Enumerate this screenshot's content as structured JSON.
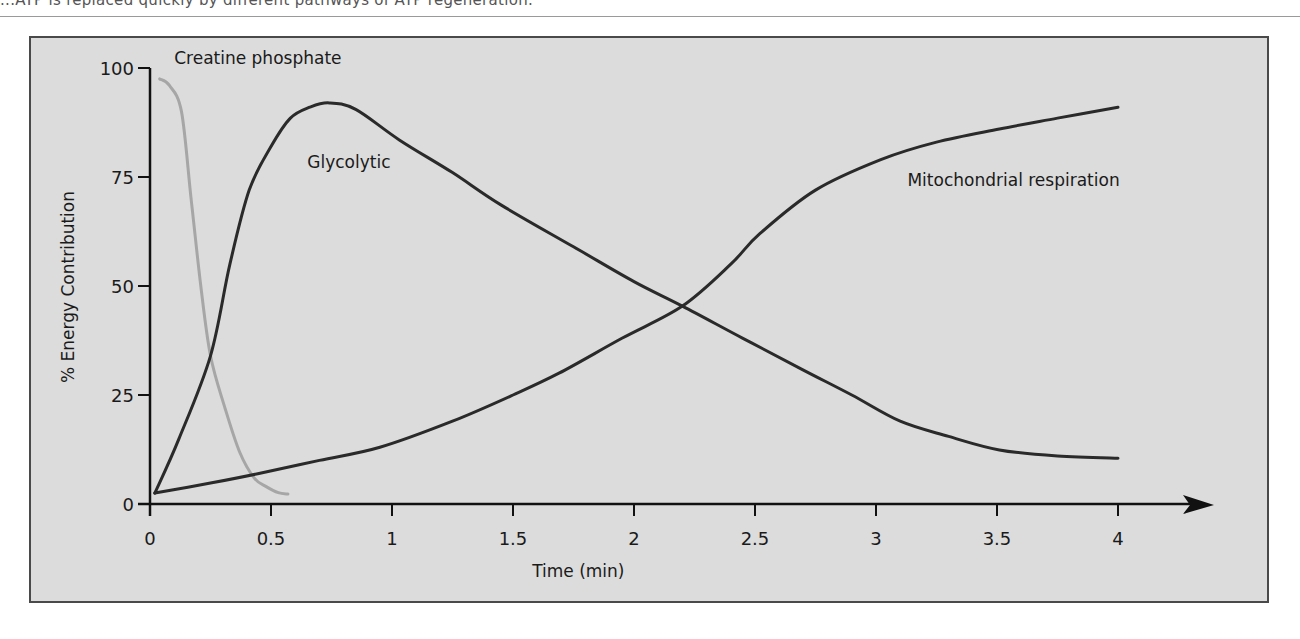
{
  "page": {
    "cut_caption": "...ATP is replaced quickly by different pathways of ATP regeneration."
  },
  "chart_data": {
    "type": "line",
    "title": "",
    "xlabel": "Time (min)",
    "ylabel": "% Energy Contribution",
    "xlim": [
      0,
      4
    ],
    "ylim": [
      0,
      100
    ],
    "x_ticks": [
      0,
      0.5,
      1,
      1.5,
      2,
      2.5,
      3,
      3.5,
      4
    ],
    "x_tick_labels": [
      "0",
      "0.5",
      "1",
      "1.5",
      "2",
      "2.5",
      "3",
      "3.5",
      "4"
    ],
    "y_ticks": [
      0,
      25,
      50,
      75,
      100
    ],
    "y_tick_labels": [
      "0",
      "25",
      "50",
      "75",
      "100"
    ],
    "grid": false,
    "legend": "inline labels",
    "series": [
      {
        "name": "Creatine phosphate",
        "color": "#a6a6a6",
        "label_pos": [
          0.1,
          101
        ],
        "x": [
          0.04,
          0.08,
          0.13,
          0.17,
          0.21,
          0.25,
          0.31,
          0.37,
          0.43,
          0.48,
          0.53,
          0.57
        ],
        "y": [
          97.5,
          96,
          90,
          70,
          50,
          34,
          22,
          12,
          6,
          4,
          2.6,
          2.3
        ]
      },
      {
        "name": "Glycolytic",
        "color": "#2a2a2a",
        "label_pos": [
          0.65,
          77
        ],
        "x": [
          0.02,
          0.12,
          0.25,
          0.33,
          0.41,
          0.5,
          0.58,
          0.66,
          0.74,
          0.85,
          1.03,
          1.25,
          1.45,
          1.75,
          2.0,
          2.2,
          2.45,
          2.69,
          2.9,
          3.1,
          3.3,
          3.51,
          3.75,
          4.0
        ],
        "y": [
          2.5,
          15,
          34,
          55,
          72,
          82,
          88.5,
          91,
          92,
          90.5,
          83.5,
          76,
          68.6,
          59,
          51,
          45.4,
          38,
          31,
          25,
          19,
          15.5,
          12.4,
          11,
          10.5
        ]
      },
      {
        "name": "Mitochondrial respiration",
        "color": "#2a2a2a",
        "label_pos": [
          3.13,
          73
        ],
        "x": [
          0.02,
          0.25,
          0.45,
          0.7,
          0.95,
          1.25,
          1.5,
          1.69,
          1.95,
          2.2,
          2.4,
          2.52,
          2.75,
          3.02,
          3.25,
          3.51,
          3.75,
          4.0
        ],
        "y": [
          2.5,
          4.8,
          7,
          10,
          13,
          19,
          25,
          30,
          38,
          45.4,
          55,
          62,
          72,
          79,
          83,
          86,
          88.5,
          91
        ]
      }
    ]
  }
}
